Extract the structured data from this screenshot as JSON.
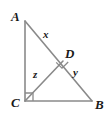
{
  "figure": {
    "type": "geometry-diagram",
    "background_color": "#ffffff",
    "stroke_color": "#8a8a8a",
    "label_color": "#1a1a1a",
    "vertices": [
      {
        "id": "A",
        "label": "A",
        "x": 25,
        "y": 21
      },
      {
        "id": "B",
        "label": "B",
        "x": 92,
        "y": 101
      },
      {
        "id": "C",
        "label": "C",
        "x": 25,
        "y": 101
      },
      {
        "id": "D",
        "label": "D",
        "x": 63,
        "y": 61
      }
    ],
    "segments": [
      {
        "id": "AC",
        "from": "A",
        "to": "C",
        "label": ""
      },
      {
        "id": "CB",
        "from": "C",
        "to": "B",
        "label": ""
      },
      {
        "id": "AB",
        "from": "A",
        "to": "B",
        "label": ""
      },
      {
        "id": "AD",
        "from": "A",
        "to": "D",
        "label": "x"
      },
      {
        "id": "DB",
        "from": "D",
        "to": "B",
        "label": "y"
      },
      {
        "id": "CD",
        "from": "C",
        "to": "D",
        "label": "z"
      }
    ],
    "segment_labels": {
      "x": "x",
      "y": "y",
      "z": "z"
    },
    "right_angles": [
      {
        "id": "angle-C",
        "at": "C",
        "marker": "square"
      },
      {
        "id": "angle-D",
        "at": "D",
        "marker": "square"
      }
    ]
  }
}
